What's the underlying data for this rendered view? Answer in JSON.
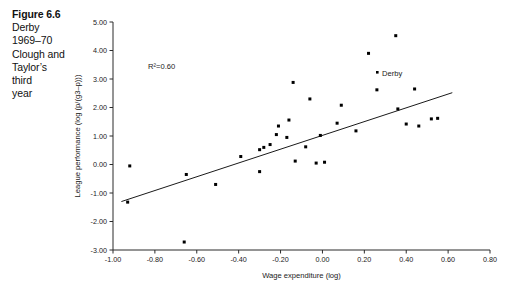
{
  "caption": {
    "title": "Figure 6.6",
    "lines": [
      "Derby",
      "1969–70",
      "Clough and",
      "Taylor’s",
      "third",
      "year"
    ]
  },
  "annotations": {
    "r_squared": "R²=0.60",
    "point_label": "Derby"
  },
  "chart_data": {
    "type": "scatter",
    "title": "",
    "xlabel": "Wage expenditure (log)",
    "ylabel": "League performance (log (p/(g3–p)))",
    "ylabel_plain": "League performance (log (p/(g3-p)))",
    "xlim": [
      -1.0,
      0.8
    ],
    "ylim": [
      -3.0,
      5.0
    ],
    "xticks": [
      -1.0,
      -0.8,
      -0.6,
      -0.4,
      -0.2,
      0.0,
      0.2,
      0.4,
      0.6,
      0.8
    ],
    "xticklabels": [
      "-1.00",
      "-0.80",
      "-0.60",
      "-0.40",
      "-0.20",
      "0.00",
      "0.20",
      "0.40",
      "0.60",
      "0.80"
    ],
    "yticks": [
      -3.0,
      -2.0,
      -1.0,
      0.0,
      1.0,
      2.0,
      3.0,
      4.0,
      5.0
    ],
    "yticklabels": [
      "-3.00",
      "-2.00",
      "-1.00",
      "0.00",
      "1.00",
      "2.00",
      "3.00",
      "4.00",
      "5.00"
    ],
    "grid": false,
    "legend": false,
    "marker": "filled-square",
    "marker_color": "#000000",
    "points": [
      {
        "x": -0.93,
        "y": -1.32
      },
      {
        "x": -0.92,
        "y": -0.05
      },
      {
        "x": -0.66,
        "y": -2.72
      },
      {
        "x": -0.65,
        "y": -0.35
      },
      {
        "x": -0.51,
        "y": -0.7
      },
      {
        "x": -0.39,
        "y": 0.28
      },
      {
        "x": -0.3,
        "y": 0.52
      },
      {
        "x": -0.3,
        "y": -0.25
      },
      {
        "x": -0.28,
        "y": 0.6
      },
      {
        "x": -0.25,
        "y": 0.7
      },
      {
        "x": -0.22,
        "y": 1.05
      },
      {
        "x": -0.21,
        "y": 1.35
      },
      {
        "x": -0.17,
        "y": 0.95
      },
      {
        "x": -0.16,
        "y": 1.56
      },
      {
        "x": -0.14,
        "y": 2.88
      },
      {
        "x": -0.13,
        "y": 0.12
      },
      {
        "x": -0.08,
        "y": 0.62
      },
      {
        "x": -0.06,
        "y": 2.3
      },
      {
        "x": -0.03,
        "y": 0.05
      },
      {
        "x": -0.01,
        "y": 1.02
      },
      {
        "x": 0.01,
        "y": 0.08
      },
      {
        "x": 0.07,
        "y": 1.45
      },
      {
        "x": 0.09,
        "y": 2.08
      },
      {
        "x": 0.16,
        "y": 1.18
      },
      {
        "x": 0.22,
        "y": 3.9
      },
      {
        "x": 0.26,
        "y": 2.62
      },
      {
        "x": 0.35,
        "y": 4.52
      },
      {
        "x": 0.36,
        "y": 1.95
      },
      {
        "x": 0.4,
        "y": 1.42
      },
      {
        "x": 0.44,
        "y": 2.65
      },
      {
        "x": 0.46,
        "y": 1.35
      },
      {
        "x": 0.52,
        "y": 1.6
      },
      {
        "x": 0.55,
        "y": 1.62
      }
    ],
    "trendline": {
      "x0": -0.96,
      "y0": -1.3,
      "x1": 0.62,
      "y1": 2.52,
      "r_squared": 0.6
    }
  }
}
